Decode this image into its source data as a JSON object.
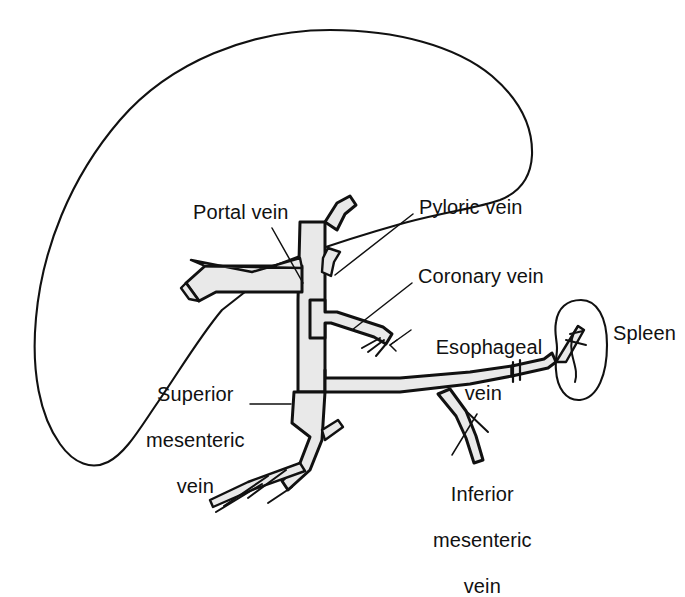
{
  "figure": {
    "background_color": "#ffffff",
    "ink_color": "#111111",
    "vessel_fill_color": "#e9e9e9",
    "width": 685,
    "height": 551
  },
  "labels": {
    "portal_vein": "Portal vein",
    "pyloric_vein": "Pyloric vein",
    "coronary_vein": "Coronary vein",
    "esophageal_vein_line1": "Esophageal",
    "esophageal_vein_line2": "vein",
    "spleen": "Spleen",
    "superior_mesenteric_line1": "Superior",
    "superior_mesenteric_line2": "mesenteric",
    "superior_mesenteric_line3": "vein",
    "inferior_mesenteric_line1": "Inferior",
    "inferior_mesenteric_line2": "mesenteric",
    "inferior_mesenteric_line3": "vein"
  },
  "structures": [
    {
      "name": "liver",
      "kind": "organ",
      "labeled": false
    },
    {
      "name": "spleen",
      "kind": "organ",
      "labeled": true
    },
    {
      "name": "portal-vein",
      "kind": "vessel",
      "labeled": true
    },
    {
      "name": "pyloric-vein",
      "kind": "vessel",
      "labeled": true
    },
    {
      "name": "coronary-vein",
      "kind": "vessel",
      "labeled": true
    },
    {
      "name": "esophageal-vein",
      "kind": "vessel",
      "labeled": true
    },
    {
      "name": "splenic-vein",
      "kind": "vessel",
      "labeled": false
    },
    {
      "name": "superior-mesenteric-vein",
      "kind": "vessel",
      "labeled": true
    },
    {
      "name": "inferior-mesenteric-vein",
      "kind": "vessel",
      "labeled": true
    }
  ]
}
